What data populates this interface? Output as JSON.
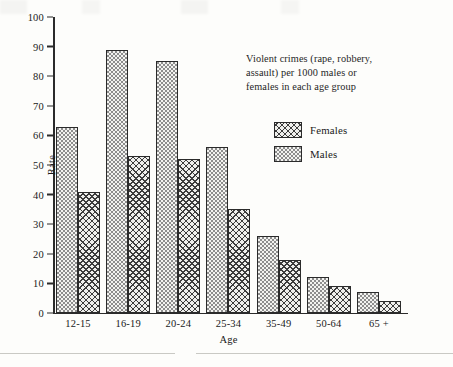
{
  "chart_data": {
    "type": "bar",
    "title": "",
    "subtitle": "",
    "xlabel": "Age",
    "ylabel": "Rate",
    "categories": [
      "12-15",
      "16-19",
      "20-24",
      "25-34",
      "35-49",
      "50-64",
      "65 +"
    ],
    "series": [
      {
        "name": "Males",
        "values": [
          63,
          89,
          85,
          56,
          26,
          12,
          7
        ]
      },
      {
        "name": "Females",
        "values": [
          41,
          53,
          52,
          35,
          18,
          9,
          4
        ]
      }
    ],
    "ylim": [
      0,
      100
    ],
    "ytick_labels": [
      "0",
      "10",
      "20",
      "30",
      "40",
      "50",
      "60",
      "70",
      "80",
      "90",
      "100"
    ],
    "ytick_values": [
      0,
      10,
      20,
      30,
      40,
      50,
      60,
      70,
      80,
      90,
      100
    ],
    "grid": false,
    "legend_position": "upper right inside plot",
    "legend_order": [
      "Females",
      "Males"
    ],
    "annotation": "Violent crimes (rape, robbery, assault) per 1000 males or females in each age group",
    "series_fill_patterns": {
      "Males": "light-dotted",
      "Females": "dark-crosshatch"
    },
    "colors": {
      "axis": "#2b2b2b",
      "bar_outline": "#2b2b2b",
      "background": "#fdfdfb",
      "pattern_dark": "#3c3c3c",
      "pattern_light": "#8d8d8d"
    },
    "group_bar_order": [
      "Males",
      "Females"
    ]
  },
  "caption": {
    "line1": "Violent crimes (rape, robbery,",
    "line2": "assault) per 1000 males or",
    "line3": "females in each age group"
  },
  "legend": {
    "items": [
      {
        "label": "Females"
      },
      {
        "label": "Males"
      }
    ]
  },
  "axes": {
    "y_title": "Rate",
    "x_title": "Age"
  }
}
